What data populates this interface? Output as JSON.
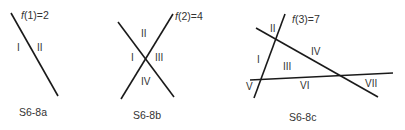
{
  "figures": [
    {
      "id": "a",
      "caption": "S6-8a",
      "function_label": {
        "f": "f",
        "arg": "(1)",
        "eq": "=2"
      },
      "lines_count": 1,
      "regions_count": 2,
      "regions": [
        "I",
        "II"
      ]
    },
    {
      "id": "b",
      "caption": "S6-8b",
      "function_label": {
        "f": "f",
        "arg": "(2)",
        "eq": "=4"
      },
      "lines_count": 2,
      "regions_count": 4,
      "regions": [
        "I",
        "II",
        "III",
        "IV"
      ]
    },
    {
      "id": "c",
      "caption": "S6-8c",
      "function_label": {
        "f": "f",
        "arg": "(3)",
        "eq": "=7"
      },
      "lines_count": 3,
      "regions_count": 7,
      "regions": [
        "I",
        "II",
        "III",
        "IV",
        "V",
        "VI",
        "VII"
      ]
    }
  ],
  "colors": {
    "line": "#1a1a1a",
    "text": "#333333",
    "background": "#ffffff"
  }
}
